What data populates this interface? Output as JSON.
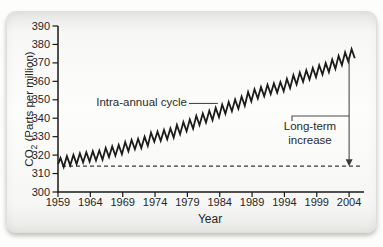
{
  "figure": {
    "card_background": "#f6f6f4",
    "plot_background": "#ffffff",
    "axis_color": "#1a1a1a"
  },
  "chart_data": {
    "type": "line",
    "title": "",
    "xlabel": "Year",
    "ylabel": "CO2 (Parts per million)",
    "ylabel_parts": {
      "prefix": "CO",
      "sub": "2",
      "suffix": " (Parts per million)"
    },
    "x_ticks": [
      1959,
      1964,
      1969,
      1974,
      1979,
      1984,
      1989,
      1994,
      1999,
      2004
    ],
    "y_ticks": [
      300,
      310,
      320,
      330,
      340,
      350,
      360,
      370,
      380,
      390
    ],
    "xlim": [
      1959,
      2006.3
    ],
    "ylim": [
      300,
      390
    ],
    "grid": false,
    "legend": "none",
    "line_color": "#1c1c1c",
    "baseline": {
      "value": 314,
      "style": "dashed",
      "color": "#3a3a3a"
    },
    "series": [
      {
        "name": "Atmospheric CO2 at Mauna Loa (seasonal zigzag)",
        "years": [
          1959,
          1960,
          1961,
          1962,
          1963,
          1964,
          1965,
          1966,
          1967,
          1968,
          1969,
          1970,
          1971,
          1972,
          1973,
          1974,
          1975,
          1976,
          1977,
          1978,
          1979,
          1980,
          1981,
          1982,
          1983,
          1984,
          1985,
          1986,
          1987,
          1988,
          1989,
          1990,
          1991,
          1992,
          1993,
          1994,
          1995,
          1996,
          1997,
          1998,
          1999,
          2000,
          2001,
          2002,
          2003,
          2004
        ],
        "annual_mean": [
          316.0,
          316.9,
          317.6,
          318.5,
          319.0,
          319.6,
          320.0,
          321.4,
          322.2,
          323.0,
          324.6,
          325.7,
          326.3,
          327.5,
          329.7,
          330.2,
          331.1,
          332.0,
          333.8,
          335.4,
          336.8,
          338.8,
          340.1,
          341.5,
          343.1,
          344.9,
          346.3,
          347.6,
          349.3,
          351.7,
          353.2,
          354.4,
          355.6,
          356.4,
          357.1,
          358.8,
          360.8,
          362.3,
          363.5,
          364.8,
          366.2,
          367.5,
          369.3,
          371.3,
          373.2,
          375.0
        ],
        "seasonal_amplitude": 2.5
      }
    ],
    "annotations": [
      {
        "id": "intra-annual",
        "text": "Intra-annual cycle",
        "points_to_year": 1983.7,
        "at_value": 348
      },
      {
        "id": "long-term",
        "text": "Long-term increase",
        "at_year": 2004,
        "from_value": 314,
        "to_value": 372.5
      }
    ]
  }
}
